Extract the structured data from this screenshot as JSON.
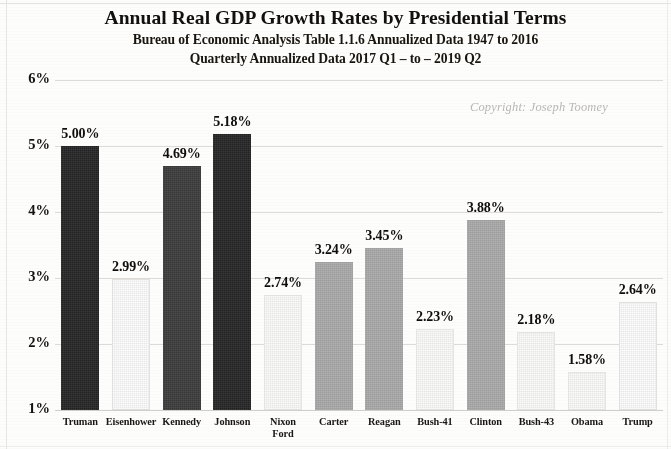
{
  "title": {
    "main": "Annual Real GDP Growth Rates by Presidential Terms",
    "sub1": "Bureau of Economic Analysis Table 1.1.6 Annualized Data 1947 to 2016",
    "sub2": "Quarterly Annualized Data 2017 Q1 – to – 2019 Q2"
  },
  "copyright": "Copyright: Joseph Toomey",
  "chart_data": {
    "type": "bar",
    "title": "Annual Real GDP Growth Rates by Presidential Terms",
    "subtitle": "Bureau of Economic Analysis Table 1.1.6 Annualized Data 1947 to 2016 / Quarterly Annualized Data 2017 Q1 – to – 2019 Q2",
    "xlabel": "",
    "ylabel": "",
    "ylim": [
      1,
      6
    ],
    "ytick_labels": [
      "6%",
      "5%",
      "4%",
      "3%",
      "2%",
      "1%"
    ],
    "ytick_values": [
      6,
      5,
      4,
      3,
      2,
      1
    ],
    "grid": true,
    "legend": "none",
    "categories": [
      "Truman",
      "Eisenhower",
      "Kennedy",
      "Johnson",
      "Nixon\nFord",
      "Carter",
      "Reagan",
      "Bush-41",
      "Clinton",
      "Bush-43",
      "Obama",
      "Trump"
    ],
    "values": [
      5.0,
      2.99,
      4.69,
      5.18,
      2.74,
      3.24,
      3.45,
      2.23,
      3.88,
      2.18,
      1.58,
      2.64
    ],
    "value_labels": [
      "5.00%",
      "2.99%",
      "4.69%",
      "5.18%",
      "2.74%",
      "3.24%",
      "3.45%",
      "2.23%",
      "3.88%",
      "2.18%",
      "1.58%",
      "2.64%"
    ],
    "bar_styles": [
      "dark",
      "light",
      "darkgray",
      "dark",
      "lightish",
      "midgray",
      "midgray",
      "lightish",
      "midgray",
      "lightish",
      "lightish",
      "light"
    ],
    "colors": {
      "dark": "#252525",
      "darkgray": "#3c3c3c",
      "midgray": "#a9a9a9",
      "light": "#fcfcfc",
      "lightish": "#fafaf9",
      "grid": "#dcdbd7",
      "text": "#15110f",
      "copyright": "#b9b8b4"
    }
  }
}
